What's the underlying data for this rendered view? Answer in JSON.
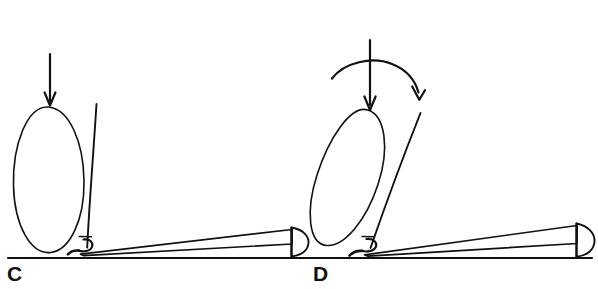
{
  "figure": {
    "type": "line-diagram",
    "style": "hand-drawn ink line art",
    "background_color": "#ffffff",
    "ink_color": "#111111",
    "panels": [
      {
        "id": "C",
        "label": "C",
        "label_position": {
          "x": 7,
          "y": 263
        },
        "elements": [
          {
            "name": "force-arrow",
            "kind": "straight-arrow",
            "direction": "down",
            "from": {
              "x": 50,
              "y": 55
            },
            "to": {
              "x": 50,
              "y": 108
            }
          },
          {
            "name": "sac-outline",
            "kind": "ellipse",
            "center": {
              "x": 48,
              "y": 182
            },
            "rx": 36,
            "ry": 75,
            "rotation_deg": 2
          },
          {
            "name": "stem-line",
            "kind": "line",
            "from": {
              "x": 96,
              "y": 104
            },
            "to": {
              "x": 87,
              "y": 249
            }
          },
          {
            "name": "base-hook",
            "kind": "hook-curl",
            "at": {
              "x": 82,
              "y": 245
            }
          },
          {
            "name": "tapered-wedge",
            "kind": "wedge",
            "from": {
              "x": 84,
              "y": 252
            },
            "to": {
              "x": 292,
              "y": 236
            }
          },
          {
            "name": "half-dome-cap",
            "kind": "semicircle",
            "at": {
              "x": 293,
              "y": 243
            },
            "radius": 16,
            "facing": "right"
          }
        ]
      },
      {
        "id": "D",
        "label": "D",
        "label_position": {
          "x": 313,
          "y": 263
        },
        "elements": [
          {
            "name": "force-arrow",
            "kind": "straight-arrow",
            "direction": "down",
            "from": {
              "x": 370,
              "y": 40
            },
            "to": {
              "x": 370,
              "y": 110
            }
          },
          {
            "name": "rotation-arrow",
            "kind": "curved-arrow",
            "direction": "clockwise",
            "start": {
              "x": 332,
              "y": 78
            },
            "end": {
              "x": 419,
              "y": 99
            }
          },
          {
            "name": "sac-outline",
            "kind": "ellipse",
            "center": {
              "x": 354,
              "y": 183
            },
            "rx": 36,
            "ry": 74,
            "rotation_deg": -19
          },
          {
            "name": "stem-line",
            "kind": "line",
            "from": {
              "x": 420,
              "y": 113
            },
            "to": {
              "x": 370,
              "y": 249
            }
          },
          {
            "name": "base-hook",
            "kind": "hook-curl",
            "at": {
              "x": 366,
              "y": 245
            }
          },
          {
            "name": "tapered-wedge",
            "kind": "wedge",
            "from": {
              "x": 368,
              "y": 254
            },
            "to": {
              "x": 577,
              "y": 233
            }
          },
          {
            "name": "half-dome-cap",
            "kind": "semicircle",
            "at": {
              "x": 578,
              "y": 241
            },
            "radius": 17,
            "facing": "right"
          }
        ]
      }
    ],
    "shared": {
      "baseline": {
        "name": "ground-baseline",
        "from": {
          "x": 8,
          "y": 258
        },
        "to": {
          "x": 592,
          "y": 258
        }
      }
    }
  }
}
